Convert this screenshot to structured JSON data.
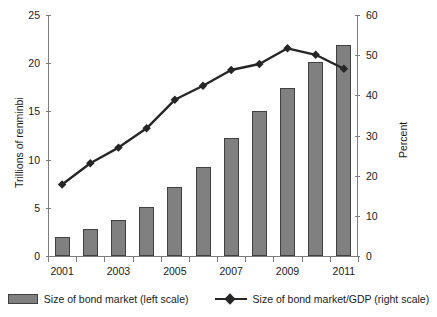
{
  "chart_data": {
    "type": "bar",
    "title": "",
    "subtitle": "",
    "xlabel": "",
    "ylabel": "Trillions of renminbi",
    "y2label": "Percent",
    "categories": [
      "2001",
      "2002",
      "2003",
      "2004",
      "2005",
      "2006",
      "2007",
      "2008",
      "2009",
      "2010",
      "2011"
    ],
    "x_tick_labels_shown": [
      "2001",
      "2003",
      "2005",
      "2007",
      "2009",
      "2011"
    ],
    "ylim": [
      0,
      25
    ],
    "y2lim": [
      0,
      60
    ],
    "y_ticks": [
      0,
      5,
      10,
      15,
      20,
      25
    ],
    "y2_ticks": [
      0,
      10,
      20,
      30,
      40,
      50,
      60
    ],
    "grid": false,
    "legend_position": "bottom",
    "series": [
      {
        "name": "Size of bond market (left scale)",
        "type": "bar",
        "axis": "left",
        "units": "Trillions of renminbi",
        "color": "#808080",
        "values": [
          2.0,
          2.8,
          3.7,
          5.1,
          7.2,
          9.2,
          12.2,
          15.0,
          17.4,
          20.1,
          21.9
        ]
      },
      {
        "name": "Size of bond market/GDP (right scale)",
        "type": "line",
        "axis": "right",
        "units": "Percent",
        "color": "#262626",
        "marker": "diamond",
        "values": [
          17.8,
          23.1,
          27.0,
          31.8,
          38.9,
          42.4,
          46.3,
          47.8,
          51.7,
          50.1,
          46.6
        ]
      }
    ]
  },
  "axes": {
    "left": {
      "title": "Trillions of renminbi",
      "tick_labels": [
        "25",
        "20",
        "15",
        "10",
        "5",
        "0"
      ]
    },
    "right": {
      "title": "Percent",
      "tick_labels": [
        "60",
        "50",
        "40",
        "30",
        "20",
        "10",
        "0"
      ]
    },
    "bottom": {
      "tick_labels": [
        "2001",
        "2003",
        "2005",
        "2007",
        "2009",
        "2011"
      ]
    }
  },
  "legend": {
    "items": [
      {
        "label": "Size of bond market (left scale)",
        "marker": "bar-swatch",
        "color": "#808080"
      },
      {
        "label": "Size of bond market/GDP (right scale)",
        "marker": "line-diamond",
        "color": "#262626"
      }
    ]
  }
}
